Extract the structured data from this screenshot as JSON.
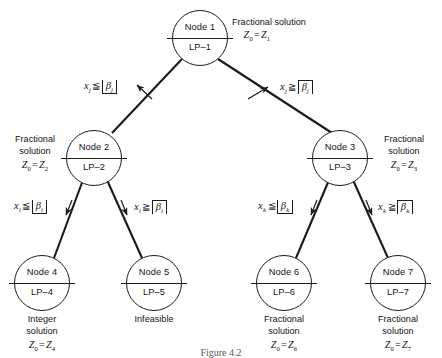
{
  "figure": {
    "caption": "Figure 4.2"
  },
  "nodes": [
    {
      "id": "node-1",
      "title": "Node 1",
      "lp": "LP–1",
      "x": 172,
      "y": 10
    },
    {
      "id": "node-2",
      "title": "Node 2",
      "lp": "LP–2",
      "x": 66,
      "y": 130
    },
    {
      "id": "node-3",
      "title": "Node 3",
      "lp": "LP–3",
      "x": 312,
      "y": 130
    },
    {
      "id": "node-4",
      "title": "Node 4",
      "lp": "LP–4",
      "x": 14,
      "y": 255
    },
    {
      "id": "node-5",
      "title": "Node 5",
      "lp": "LP–5",
      "x": 126,
      "y": 255
    },
    {
      "id": "node-6",
      "title": "Node 6",
      "lp": "LP–6",
      "x": 256,
      "y": 255
    },
    {
      "id": "node-7",
      "title": "Node 7",
      "lp": "LP–7",
      "x": 370,
      "y": 255
    }
  ],
  "annotations": {
    "node1": {
      "line1": "Fractional solution",
      "z_var": "Z",
      "z_sub": "0",
      "z_rhs": "Z",
      "z_rhs_sub": "1"
    },
    "node2": {
      "line1": "Fractional",
      "line2": "solution",
      "z_var": "Z",
      "z_sub": "0",
      "z_rhs": "Z",
      "z_rhs_sub": "2"
    },
    "node3": {
      "line1": "Fractional",
      "line2": "solution",
      "z_var": "Z",
      "z_sub": "0",
      "z_rhs": "Z",
      "z_rhs_sub": "3"
    },
    "node4": {
      "line1": "Integer",
      "line2": "solution",
      "z_var": "Z",
      "z_sub": "0",
      "z_rhs": "Z",
      "z_rhs_sub": "4"
    },
    "node5": {
      "line1": "Infeasible"
    },
    "node6": {
      "line1": "Fractional",
      "line2": "solution",
      "z_var": "Z",
      "z_sub": "0",
      "z_rhs": "Z",
      "z_rhs_sub": "6"
    },
    "node7": {
      "line1": "Fractional",
      "line2": "solution",
      "z_var": "Z",
      "z_sub": "0",
      "z_rhs": "Z",
      "z_rhs_sub": "7"
    }
  },
  "edge_labels": [
    {
      "id": "edge-label-1-2",
      "var": "x",
      "var_sub": "j",
      "rel": "≦",
      "bracket": "floor",
      "beta": "β",
      "beta_sub": "j"
    },
    {
      "id": "edge-label-1-3",
      "var": "x",
      "var_sub": "j",
      "rel": "≧",
      "bracket": "ceil",
      "beta": "β",
      "beta_sub": "j"
    },
    {
      "id": "edge-label-2-4",
      "var": "x",
      "var_sub": "i",
      "rel": "≦",
      "bracket": "floor",
      "beta": "β",
      "beta_sub": "i"
    },
    {
      "id": "edge-label-2-5",
      "var": "x",
      "var_sub": "i",
      "rel": "≧",
      "bracket": "ceil",
      "beta": "β",
      "beta_sub": "i"
    },
    {
      "id": "edge-label-3-6",
      "var": "x",
      "var_sub": "k",
      "rel": "≦",
      "bracket": "floor",
      "beta": "β",
      "beta_sub": "k"
    },
    {
      "id": "edge-label-3-7",
      "var": "x",
      "var_sub": "k",
      "rel": "≧",
      "bracket": "ceil",
      "beta": "β",
      "beta_sub": "k"
    }
  ],
  "colors": {
    "ink": "#1b1b1b",
    "background": "#ffffff"
  }
}
